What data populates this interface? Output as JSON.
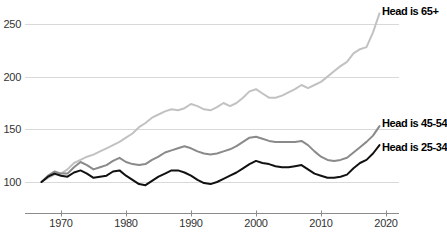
{
  "chart_data": {
    "type": "line",
    "title": "",
    "xlabel": "",
    "ylabel": "",
    "grid": "horizontal",
    "legend_position": "right-edge-labels",
    "xticks": [
      1970,
      1980,
      1990,
      2000,
      2010,
      2020
    ],
    "yticks": [
      100,
      150,
      200,
      250
    ],
    "xlim": [
      1965.5,
      2022.5
    ],
    "ylim": [
      85,
      262
    ],
    "colors": {
      "grid": "#d9d9d9",
      "axis": "#8c8c8c",
      "tick_text": "#333333",
      "label_text": "#000000"
    },
    "x": [
      1967,
      1968,
      1969,
      1970,
      1971,
      1972,
      1973,
      1974,
      1975,
      1976,
      1977,
      1978,
      1979,
      1980,
      1981,
      1982,
      1983,
      1984,
      1985,
      1986,
      1987,
      1988,
      1989,
      1990,
      1991,
      1992,
      1993,
      1994,
      1995,
      1996,
      1997,
      1998,
      1999,
      2000,
      2001,
      2002,
      2003,
      2004,
      2005,
      2006,
      2007,
      2008,
      2009,
      2010,
      2011,
      2012,
      2013,
      2014,
      2015,
      2016,
      2017,
      2018,
      2019
    ],
    "series": [
      {
        "name": "Head is 65+",
        "color": "#c2c2c2",
        "values": [
          100,
          104,
          107,
          108,
          112,
          118,
          121,
          124,
          126,
          129,
          132,
          135,
          138,
          142,
          146,
          152,
          156,
          161,
          164,
          167,
          169,
          168,
          170,
          174,
          172,
          169,
          168,
          171,
          175,
          172,
          175,
          180,
          186,
          188,
          184,
          180,
          180,
          182,
          185,
          188,
          192,
          189,
          192,
          195,
          200,
          205,
          210,
          214,
          222,
          226,
          228,
          242,
          260
        ]
      },
      {
        "name": "Head is 45-54",
        "color": "#8a8a8a",
        "values": [
          100,
          106,
          110,
          108,
          108,
          114,
          119,
          116,
          112,
          114,
          116,
          120,
          123,
          119,
          117,
          116,
          117,
          121,
          124,
          128,
          130,
          132,
          134,
          132,
          129,
          127,
          126,
          127,
          129,
          131,
          134,
          138,
          142,
          143,
          141,
          139,
          138,
          138,
          138,
          138,
          139,
          135,
          129,
          124,
          121,
          120,
          121,
          123,
          128,
          133,
          138,
          144,
          153
        ]
      },
      {
        "name": "Head is 25-34",
        "color": "#111111",
        "values": [
          100,
          105,
          108,
          106,
          105,
          109,
          111,
          108,
          104,
          105,
          106,
          110,
          111,
          106,
          102,
          98,
          97,
          101,
          105,
          108,
          111,
          111,
          109,
          106,
          102,
          99,
          98,
          100,
          103,
          106,
          109,
          113,
          117,
          120,
          118,
          117,
          115,
          114,
          114,
          115,
          116,
          112,
          108,
          106,
          104,
          104,
          105,
          107,
          113,
          118,
          121,
          127,
          135
        ]
      }
    ]
  }
}
